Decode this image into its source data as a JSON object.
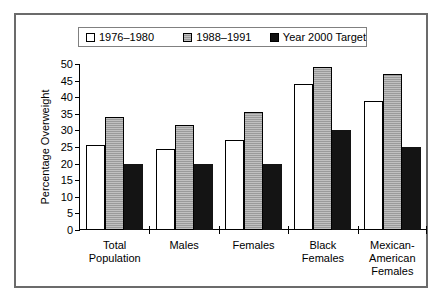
{
  "chart_data": {
    "type": "bar",
    "title": "",
    "xlabel": "",
    "ylabel": "Percentage Overweight",
    "ylim": [
      0,
      50
    ],
    "yticks": [
      0,
      5,
      10,
      15,
      20,
      25,
      30,
      35,
      40,
      45,
      50
    ],
    "grid": false,
    "legend_position": "top",
    "categories": [
      "Total\nPopulation",
      "Males",
      "Females",
      "Black\nFemales",
      "Mexican-\nAmerican\nFemales"
    ],
    "series": [
      {
        "name": "1976–1980",
        "swatch": "white",
        "values": [
          25.5,
          24.3,
          27.0,
          44.0,
          39.0
        ]
      },
      {
        "name": "1988–1991",
        "swatch": "gray",
        "values": [
          34.0,
          31.7,
          35.5,
          49.0,
          47.0
        ]
      },
      {
        "name": "Year 2000 Target",
        "swatch": "black",
        "values": [
          20.0,
          20.0,
          20.0,
          30.0,
          25.0
        ]
      }
    ]
  },
  "colors": {
    "series_1976_1980": "#ffffff",
    "series_1988_1991": "#9a9a9a",
    "series_year_2000_target": "#141414",
    "frame": "#6b6b6b",
    "axis": "#000000"
  }
}
